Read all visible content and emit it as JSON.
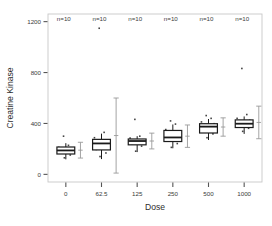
{
  "chart_data": {
    "type": "box",
    "title": "",
    "xlabel": "Dose",
    "ylabel": "Creatine Kinase",
    "categories": [
      "0",
      "62.5",
      "125",
      "250",
      "500",
      "1000"
    ],
    "xtick_labels": [
      "0",
      "62.5",
      "125",
      "250",
      "500",
      "1000"
    ],
    "ytick_labels": [
      "0",
      "400",
      "800",
      "1200"
    ],
    "ytick_values": [
      0,
      400,
      800,
      1200
    ],
    "ylim": [
      -60,
      1260
    ],
    "grid": false,
    "legend": false,
    "group_annotations": [
      "n=10",
      "n=10",
      "n=10",
      "n=10",
      "n=10",
      "n=10"
    ],
    "annotation_y": 1225,
    "box_color": "#ffffff",
    "line_color": "#1a1a1a",
    "point_color": "#444444",
    "errorbar_color": "#9a9a9a",
    "boxes": [
      {
        "category": "0",
        "min": 118,
        "q1": 160,
        "median": 188,
        "q3": 215,
        "max": 245,
        "mean": 190,
        "sd": 62,
        "points": [
          130,
          152,
          168,
          175,
          183,
          192,
          200,
          212,
          228,
          300
        ]
      },
      {
        "category": "62.5",
        "min": 120,
        "q1": 192,
        "median": 243,
        "q3": 275,
        "max": 320,
        "mean": 305,
        "sd": 295,
        "points": [
          140,
          168,
          196,
          215,
          232,
          248,
          262,
          288,
          330,
          1148
        ]
      },
      {
        "category": "125",
        "min": 175,
        "q1": 232,
        "median": 262,
        "q3": 278,
        "max": 300,
        "mean": 262,
        "sd": 62,
        "points": [
          182,
          222,
          238,
          250,
          258,
          265,
          272,
          285,
          300,
          432
        ]
      },
      {
        "category": "250",
        "min": 205,
        "q1": 258,
        "median": 290,
        "q3": 345,
        "max": 392,
        "mean": 300,
        "sd": 88,
        "points": [
          212,
          242,
          262,
          278,
          290,
          305,
          330,
          352,
          395,
          420
        ]
      },
      {
        "category": "500",
        "min": 270,
        "q1": 325,
        "median": 375,
        "q3": 398,
        "max": 435,
        "mean": 372,
        "sd": 72,
        "points": [
          288,
          318,
          342,
          362,
          378,
          388,
          398,
          412,
          440,
          462
        ]
      },
      {
        "category": "1000",
        "min": 318,
        "q1": 368,
        "median": 398,
        "q3": 428,
        "max": 455,
        "mean": 408,
        "sd": 128,
        "points": [
          338,
          362,
          380,
          392,
          400,
          412,
          425,
          440,
          470,
          832
        ]
      }
    ]
  },
  "axes": {
    "y_title": "Creatine Kinase",
    "x_title": "Dose"
  }
}
